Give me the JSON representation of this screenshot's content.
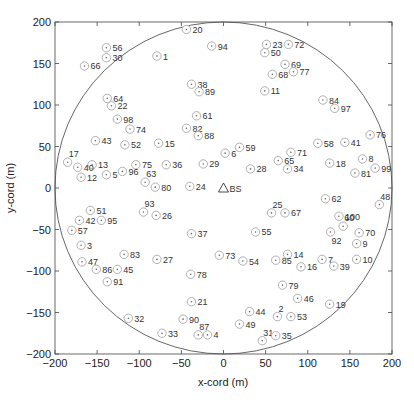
{
  "chart_data": {
    "type": "scatter",
    "title": "",
    "xlabel": "x-cord (m)",
    "ylabel": "y-cord (m)",
    "xlim": [
      -200,
      200
    ],
    "ylim": [
      -200,
      200
    ],
    "xticks": [
      -200,
      -150,
      -100,
      -50,
      0,
      50,
      100,
      150,
      200
    ],
    "yticks": [
      -200,
      -150,
      -100,
      -50,
      0,
      50,
      100,
      150,
      200
    ],
    "grid": false,
    "legend": null,
    "cell_boundary": {
      "shape": "circle",
      "center": [
        0,
        0
      ],
      "radius": 200
    },
    "base_station": {
      "label": "BS",
      "marker": "triangle",
      "x": 0,
      "y": 0
    },
    "series": [
      {
        "name": "users",
        "marker": "circled-dot",
        "points": [
          {
            "id": 1,
            "x": -79,
            "y": 159
          },
          {
            "id": 2,
            "x": 64,
            "y": -155
          },
          {
            "id": 3,
            "x": -169,
            "y": -69
          },
          {
            "id": 4,
            "x": -19,
            "y": -177
          },
          {
            "id": 5,
            "x": -139,
            "y": 16
          },
          {
            "id": 6,
            "x": 2,
            "y": 42
          },
          {
            "id": 7,
            "x": 117,
            "y": -86
          },
          {
            "id": 8,
            "x": 165,
            "y": 35
          },
          {
            "id": 9,
            "x": 158,
            "y": -67
          },
          {
            "id": 10,
            "x": 158,
            "y": -86
          },
          {
            "id": 11,
            "x": 49,
            "y": 117
          },
          {
            "id": 12,
            "x": -169,
            "y": 13
          },
          {
            "id": 13,
            "x": -156,
            "y": 28
          },
          {
            "id": 14,
            "x": 76,
            "y": -80
          },
          {
            "id": 15,
            "x": -77,
            "y": 54
          },
          {
            "id": 16,
            "x": 92,
            "y": -95
          },
          {
            "id": 17,
            "x": -185,
            "y": 31
          },
          {
            "id": 18,
            "x": 126,
            "y": 30
          },
          {
            "id": 19,
            "x": 126,
            "y": -140
          },
          {
            "id": 20,
            "x": -44,
            "y": 191
          },
          {
            "id": 21,
            "x": -38,
            "y": -137
          },
          {
            "id": 22,
            "x": -133,
            "y": 99
          },
          {
            "id": 23,
            "x": 51,
            "y": 173
          },
          {
            "id": 24,
            "x": -40,
            "y": 2
          },
          {
            "id": 25,
            "x": 57,
            "y": -30
          },
          {
            "id": 26,
            "x": -80,
            "y": -33
          },
          {
            "id": 27,
            "x": -79,
            "y": -86
          },
          {
            "id": 28,
            "x": 32,
            "y": 23
          },
          {
            "id": 29,
            "x": -24,
            "y": 29
          },
          {
            "id": 30,
            "x": -139,
            "y": 157
          },
          {
            "id": 31,
            "x": 46,
            "y": -184
          },
          {
            "id": 32,
            "x": -113,
            "y": -157
          },
          {
            "id": 33,
            "x": -73,
            "y": -175
          },
          {
            "id": 34,
            "x": 76,
            "y": 23
          },
          {
            "id": 35,
            "x": 62,
            "y": -178
          },
          {
            "id": 36,
            "x": -68,
            "y": 28
          },
          {
            "id": 37,
            "x": -38,
            "y": -55
          },
          {
            "id": 38,
            "x": -38,
            "y": 125
          },
          {
            "id": 39,
            "x": 131,
            "y": -94
          },
          {
            "id": 40,
            "x": -173,
            "y": 25
          },
          {
            "id": 41,
            "x": 144,
            "y": 55
          },
          {
            "id": 42,
            "x": -171,
            "y": -39
          },
          {
            "id": 43,
            "x": -152,
            "y": 57
          },
          {
            "id": 44,
            "x": 31,
            "y": -149
          },
          {
            "id": 45,
            "x": -126,
            "y": -98
          },
          {
            "id": 46,
            "x": 88,
            "y": -133
          },
          {
            "id": 47,
            "x": -168,
            "y": -89
          },
          {
            "id": 48,
            "x": 185,
            "y": -20
          },
          {
            "id": 49,
            "x": 19,
            "y": -164
          },
          {
            "id": 50,
            "x": 49,
            "y": 163
          },
          {
            "id": 51,
            "x": -158,
            "y": -27
          },
          {
            "id": 52,
            "x": -117,
            "y": 52
          },
          {
            "id": 53,
            "x": 80,
            "y": -155
          },
          {
            "id": 54,
            "x": 23,
            "y": -88
          },
          {
            "id": 55,
            "x": 38,
            "y": -53
          },
          {
            "id": 56,
            "x": -139,
            "y": 169
          },
          {
            "id": 57,
            "x": -180,
            "y": -51
          },
          {
            "id": 58,
            "x": 112,
            "y": 54
          },
          {
            "id": 59,
            "x": 19,
            "y": 49
          },
          {
            "id": 60,
            "x": 142,
            "y": -46
          },
          {
            "id": 61,
            "x": -32,
            "y": 87
          },
          {
            "id": 62,
            "x": 121,
            "y": -13
          },
          {
            "id": 63,
            "x": -93,
            "y": 7
          },
          {
            "id": 64,
            "x": -138,
            "y": 108
          },
          {
            "id": 65,
            "x": 65,
            "y": 33
          },
          {
            "id": 66,
            "x": -165,
            "y": 147
          },
          {
            "id": 67,
            "x": 73,
            "y": -30
          },
          {
            "id": 68,
            "x": 58,
            "y": 137
          },
          {
            "id": 69,
            "x": 73,
            "y": 149
          },
          {
            "id": 70,
            "x": 161,
            "y": -54
          },
          {
            "id": 71,
            "x": 80,
            "y": 43
          },
          {
            "id": 72,
            "x": 77,
            "y": 173
          },
          {
            "id": 73,
            "x": -5,
            "y": -81
          },
          {
            "id": 74,
            "x": -111,
            "y": 71
          },
          {
            "id": 75,
            "x": -104,
            "y": 28
          },
          {
            "id": 76,
            "x": 174,
            "y": 64
          },
          {
            "id": 77,
            "x": 83,
            "y": 140
          },
          {
            "id": 78,
            "x": -39,
            "y": -104
          },
          {
            "id": 79,
            "x": 70,
            "y": -117
          },
          {
            "id": 80,
            "x": -81,
            "y": 1
          },
          {
            "id": 81,
            "x": 156,
            "y": 18
          },
          {
            "id": 82,
            "x": -44,
            "y": 72
          },
          {
            "id": 83,
            "x": -118,
            "y": -80
          },
          {
            "id": 84,
            "x": 118,
            "y": 106
          },
          {
            "id": 85,
            "x": 62,
            "y": -87
          },
          {
            "id": 86,
            "x": -151,
            "y": -98
          },
          {
            "id": 87,
            "x": -30,
            "y": -177
          },
          {
            "id": 88,
            "x": -30,
            "y": 63
          },
          {
            "id": 89,
            "x": -29,
            "y": 116
          },
          {
            "id": 90,
            "x": -48,
            "y": -158
          },
          {
            "id": 91,
            "x": -138,
            "y": -113
          },
          {
            "id": 92,
            "x": 127,
            "y": -53
          },
          {
            "id": 93,
            "x": -95,
            "y": -29
          },
          {
            "id": 94,
            "x": -14,
            "y": 171
          },
          {
            "id": 95,
            "x": -145,
            "y": -39
          },
          {
            "id": 96,
            "x": -120,
            "y": 20
          },
          {
            "id": 97,
            "x": 132,
            "y": 96
          },
          {
            "id": 98,
            "x": -126,
            "y": 83
          },
          {
            "id": 99,
            "x": 180,
            "y": 24
          },
          {
            "id": 100,
            "x": 137,
            "y": -34
          }
        ]
      }
    ]
  },
  "label_offsets": {
    "above": [
      17,
      63,
      93,
      25,
      87,
      31,
      2,
      48,
      60
    ],
    "below": [
      92
    ]
  },
  "colors": {
    "axis": "#444444",
    "circle": "#555555",
    "marker": "#b0b0b0",
    "marker_dot": "#666666",
    "text": "#222222"
  }
}
